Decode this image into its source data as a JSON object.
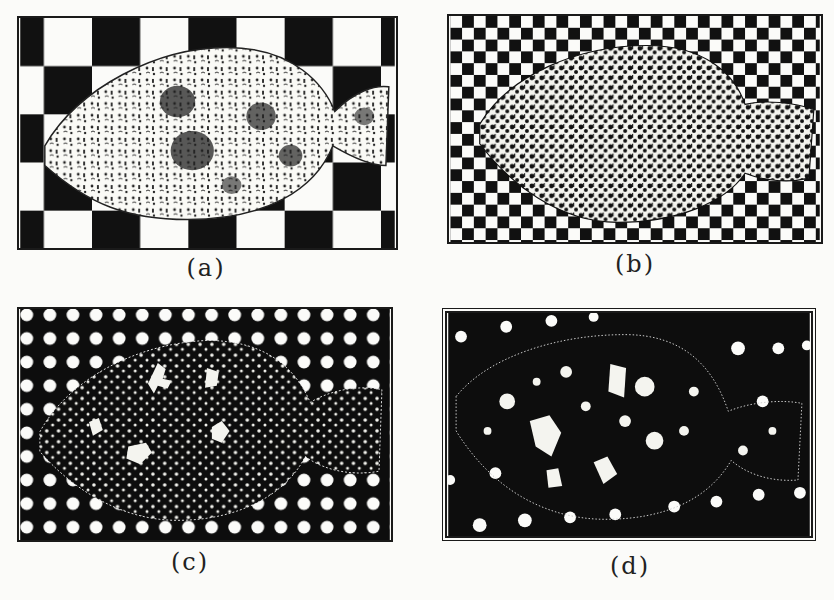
{
  "figure": {
    "panels": [
      {
        "id": "a",
        "label": "(a)",
        "background": "large-checkerboard",
        "fish_tone": "light-mottled"
      },
      {
        "id": "b",
        "label": "(b)",
        "background": "small-checkerboard",
        "fish_tone": "high-contrast-mottled"
      },
      {
        "id": "c",
        "label": "(c)",
        "background": "regular-white-dots-on-black",
        "fish_tone": "dark-spotted"
      },
      {
        "id": "d",
        "label": "(d)",
        "background": "sparse-white-dots-on-black",
        "fish_tone": "dark-with-white-blotches"
      }
    ]
  },
  "colors": {
    "ink": "#111111",
    "paper": "#fbfbf9"
  }
}
